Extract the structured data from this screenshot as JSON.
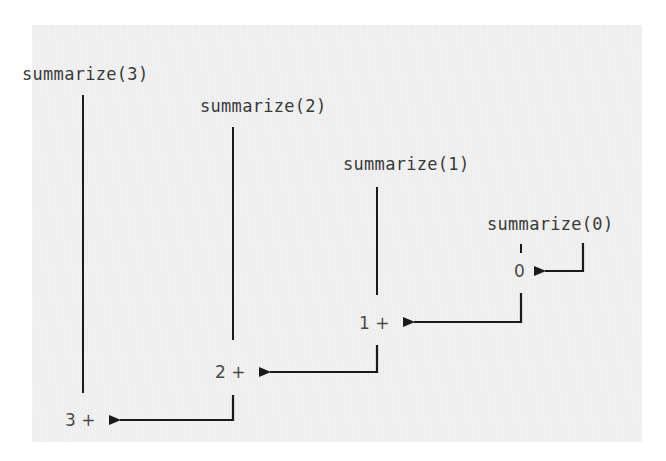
{
  "diagram": {
    "type": "recursion-call-trace",
    "calls": [
      {
        "label": "summarize(3)",
        "result_label": "3 +"
      },
      {
        "label": "summarize(2)",
        "result_label": "2 +"
      },
      {
        "label": "summarize(1)",
        "result_label": "1 +"
      },
      {
        "label": "summarize(0)",
        "result_label": "0"
      }
    ],
    "colors": {
      "background": "#f1f1f1",
      "line": "#1a1a1a",
      "text": "#3a3a3a"
    }
  }
}
